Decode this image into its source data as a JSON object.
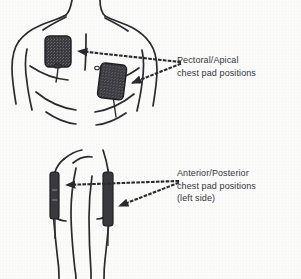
{
  "figure": {
    "type": "medical-illustration",
    "background_color": "#fbfbfa",
    "ink_color": "#2a2a2e",
    "pad_fill_color": "#3a3a3e",
    "text_color": "#35353a"
  },
  "labels": {
    "pectoral": {
      "line1": "Pectoral/Apical",
      "line2": "chest pad positions"
    },
    "anterior": {
      "line1": "Anterior/Posterior",
      "line2": "chest pad positions",
      "line3": "(left side)"
    }
  },
  "diagram": {
    "views": [
      {
        "name": "anterior-torso-view",
        "description": "front view of upper torso with neck and shoulders",
        "pads": [
          {
            "name": "pectoral-pad",
            "position": "upper right chest (viewer left)",
            "shape": "rounded-rectangle"
          },
          {
            "name": "apical-pad",
            "position": "lower left chest (viewer right)",
            "shape": "rounded-rectangle"
          }
        ]
      },
      {
        "name": "lateral-torso-view",
        "description": "side view of torso showing left side",
        "pads": [
          {
            "name": "anterior-pad",
            "position": "front of left side",
            "shape": "narrow-vertical-strip"
          },
          {
            "name": "posterior-pad",
            "position": "back of left side",
            "shape": "narrow-vertical-strip"
          }
        ]
      }
    ],
    "connectors": [
      {
        "name": "pectoral-pad-arrow",
        "style": "dotted",
        "arrowhead": "solid-triangle",
        "points_to": "pectoral-pad"
      },
      {
        "name": "apical-pad-arrow",
        "style": "dotted",
        "arrowhead": "solid-triangle",
        "points_to": "apical-pad"
      },
      {
        "name": "anterior-pad-arrow",
        "style": "dotted",
        "arrowhead": "solid-triangle",
        "points_to": "anterior-pad"
      },
      {
        "name": "posterior-pad-arrow",
        "style": "dotted",
        "arrowhead": "solid-triangle",
        "points_to": "posterior-pad"
      }
    ]
  }
}
